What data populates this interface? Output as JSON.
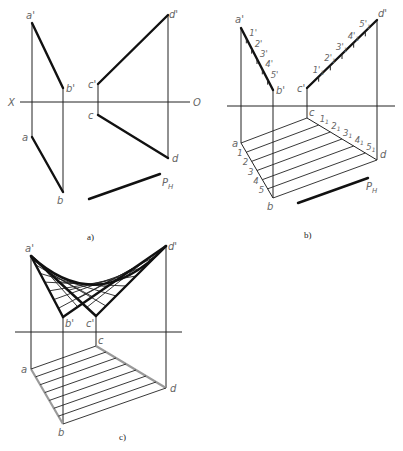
{
  "figure": {
    "panels": [
      {
        "id": "a",
        "caption": "a)",
        "caption_pos": [
          87,
          240
        ],
        "axis": {
          "y": 102,
          "x1": 20,
          "x2": 190,
          "left_label": "X",
          "right_label": "O",
          "left_label_pos": [
            8,
            106
          ],
          "right_label_pos": [
            193,
            106
          ]
        },
        "points": {
          "a_prime": {
            "label": "a'",
            "xy": [
              32,
              23
            ],
            "label_pos": [
              26,
              19
            ]
          },
          "b_prime": {
            "label": "b'",
            "xy": [
              63,
              88
            ],
            "label_pos": [
              66,
              92
            ]
          },
          "c_prime": {
            "label": "c'",
            "xy": [
              98,
              84
            ],
            "label_pos": [
              88,
              88
            ]
          },
          "d_prime": {
            "label": "d'",
            "xy": [
              168,
              15
            ],
            "label_pos": [
              169,
              18
            ]
          },
          "a": {
            "label": "a",
            "xy": [
              32,
              137
            ],
            "label_pos": [
              22,
              141
            ]
          },
          "b": {
            "label": "b",
            "xy": [
              63,
              192
            ],
            "label_pos": [
              57,
              204
            ]
          },
          "c": {
            "label": "c",
            "xy": [
              98,
              115
            ],
            "label_pos": [
              88,
              119
            ]
          },
          "d": {
            "label": "d",
            "xy": [
              168,
              158
            ],
            "label_pos": [
              172,
              162
            ]
          }
        },
        "ph_line": {
          "from": [
            89,
            199
          ],
          "to": [
            160,
            174
          ],
          "label": "P",
          "subscript": "H",
          "label_pos": [
            162,
            186
          ]
        }
      },
      {
        "id": "b",
        "caption": "b)",
        "caption_pos": [
          304,
          238
        ],
        "axis": {
          "y": 106,
          "x1": 227,
          "x2": 395
        },
        "points": {
          "a_prime": {
            "label": "a'",
            "xy": [
              241,
              28
            ],
            "label_pos": [
              235,
              23
            ]
          },
          "b_prime": {
            "label": "b'",
            "xy": [
              273,
              90
            ],
            "label_pos": [
              276,
              94
            ]
          },
          "c_prime": {
            "label": "c'",
            "xy": [
              307,
              88
            ],
            "label_pos": [
              297,
              92
            ]
          },
          "d_prime": {
            "label": "d'",
            "xy": [
              377,
              20
            ],
            "label_pos": [
              378,
              17
            ]
          },
          "a": {
            "label": "a",
            "xy": [
              241,
              143
            ],
            "label_pos": [
              232,
              147
            ]
          },
          "b": {
            "label": "b",
            "xy": [
              273,
              198
            ],
            "label_pos": [
              267,
              210
            ]
          },
          "c": {
            "label": "c",
            "xy": [
              307,
              118
            ],
            "label_pos": [
              309,
              116
            ]
          },
          "d": {
            "label": "d",
            "xy": [
              377,
              160
            ],
            "label_pos": [
              380,
              158
            ]
          }
        },
        "divisions_ab": [
          "1",
          "2",
          "3",
          "4",
          "5"
        ],
        "divisions_ab_prime": [
          "1'",
          "2'",
          "3'",
          "4'",
          "5'"
        ],
        "divisions_cd": [
          "1",
          "2",
          "3",
          "4",
          "5"
        ],
        "divisions_cd_sub": "1",
        "ph_line": {
          "from": [
            298,
            203
          ],
          "to": [
            368,
            178
          ],
          "label": "P",
          "subscript": "H",
          "label_pos": [
            366,
            190
          ]
        }
      },
      {
        "id": "c",
        "caption": "c)",
        "caption_pos": [
          119,
          440
        ],
        "axis": {
          "y": 332,
          "x1": 15,
          "x2": 182
        },
        "points": {
          "a_prime": {
            "label": "a'",
            "xy": [
              31,
              256
            ],
            "label_pos": [
              25,
              252
            ]
          },
          "b_prime": {
            "label": "b'",
            "xy": [
              63,
              317
            ],
            "label_pos": [
              65,
              327
            ]
          },
          "c_prime": {
            "label": "c'",
            "xy": [
              96,
              316
            ],
            "label_pos": [
              86,
              327
            ]
          },
          "d_prime": {
            "label": "d'",
            "xy": [
              166,
              246
            ],
            "label_pos": [
              168,
              250
            ]
          },
          "a": {
            "label": "a",
            "xy": [
              31,
              369
            ],
            "label_pos": [
              21,
              373
            ]
          },
          "b": {
            "label": "b",
            "xy": [
              63,
              424
            ],
            "label_pos": [
              58,
              436
            ]
          },
          "c": {
            "label": "c",
            "xy": [
              96,
              346
            ],
            "label_pos": [
              98,
              344
            ]
          },
          "d": {
            "label": "d",
            "xy": [
              166,
              388
            ],
            "label_pos": [
              170,
              392
            ]
          }
        },
        "ruling_count": 7
      }
    ]
  }
}
